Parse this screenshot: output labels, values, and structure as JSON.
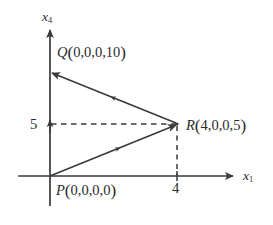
{
  "figure": {
    "background_color": "#ffffff",
    "line_color": "#3a3a3a",
    "text_color": "#2b2b2b"
  },
  "axes": {
    "vertical": {
      "label": "x",
      "subscript": "4",
      "name": "x4-axis"
    },
    "horizontal": {
      "label": "x",
      "subscript": "1",
      "name": "x1-axis"
    }
  },
  "ticks": [
    {
      "axis": "vertical",
      "label": "5",
      "value": 5
    },
    {
      "axis": "horizontal",
      "label": "4",
      "value": 4
    }
  ],
  "points": [
    {
      "id": "P",
      "name": "P",
      "coords_text": "0,0,0,0",
      "label": "P(0,0,0,0)",
      "coords": [
        0,
        0,
        0,
        0
      ],
      "px": [
        50,
        176
      ]
    },
    {
      "id": "Q",
      "name": "Q",
      "coords_text": "0,0,0,10",
      "label": "Q(0,0,0,10)",
      "coords": [
        0,
        0,
        0,
        10
      ],
      "px": [
        50,
        72
      ]
    },
    {
      "id": "R",
      "name": "R",
      "coords_text": "4,0,0,5",
      "label": "R(4,0,0,5)",
      "coords": [
        4,
        0,
        0,
        5
      ],
      "px": [
        177,
        124
      ]
    }
  ],
  "vectors": [
    {
      "name": "vector-p-to-r",
      "from": "P",
      "to": "R"
    },
    {
      "name": "vector-r-to-q",
      "from": "R",
      "to": "Q"
    }
  ],
  "guides": [
    {
      "name": "horizontal-dashed-guide-5",
      "orientation": "horizontal",
      "value": 5
    },
    {
      "name": "vertical-dashed-guide-4",
      "orientation": "vertical",
      "value": 4
    }
  ]
}
